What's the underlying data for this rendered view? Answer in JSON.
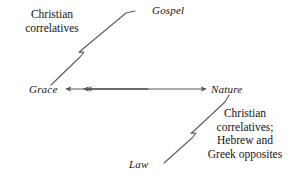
{
  "figure": {
    "kind": "quadrant-axes-diagram",
    "line_color": "#55595c",
    "text_color": "#141414",
    "background": "#ffffff"
  },
  "axes": {
    "vertical": {
      "top_label": "Gospel",
      "bottom_label": "Law"
    },
    "horizontal": {
      "left_label": "Grace",
      "right_label": "Nature"
    }
  },
  "annotations": {
    "upper_left": {
      "lines": [
        "Christian",
        "correlatives"
      ],
      "target": "gospel-grace-axis"
    },
    "lower_right": {
      "lines": [
        "Christian",
        "correlatives;",
        "Hebrew and",
        "Greek opposites"
      ],
      "target": "nature-law-axis"
    }
  }
}
